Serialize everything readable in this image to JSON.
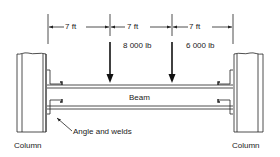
{
  "diagram": {
    "dimensions": [
      {
        "label": "7 ft"
      },
      {
        "label": "7 ft"
      },
      {
        "label": "7 ft"
      }
    ],
    "loads": [
      {
        "label": "8 000 lb"
      },
      {
        "label": "6 000 lb"
      }
    ],
    "beam_label": "Beam",
    "connection_label": "Angle and welds",
    "left_column_label": "Column",
    "right_column_label": "Column"
  }
}
